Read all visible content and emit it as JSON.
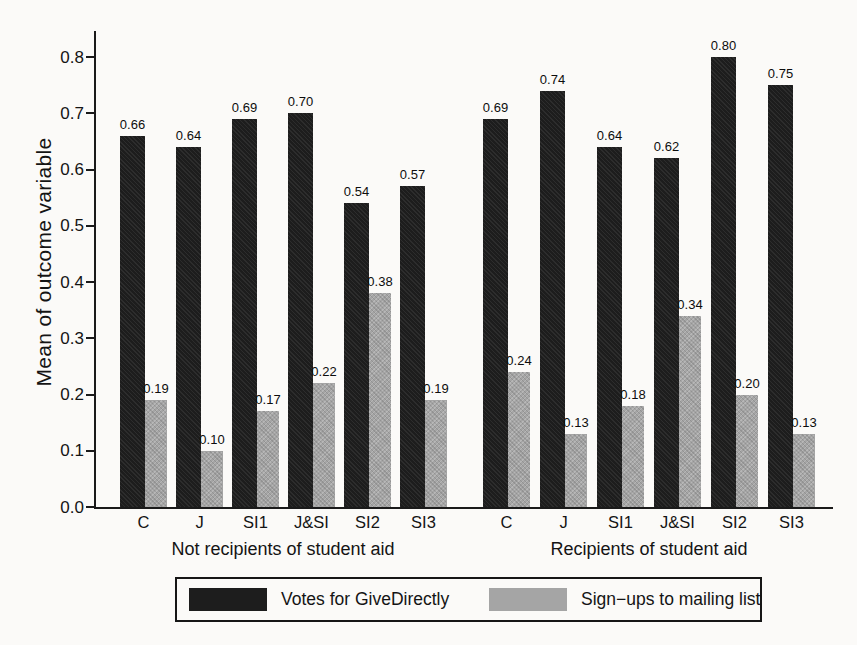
{
  "colors": {
    "dark": "#1d1d1d",
    "gray": "#a5a5a5",
    "axis": "#1a1a1a",
    "background": "#fbfaf8",
    "text": "#141414"
  },
  "chart_data": {
    "type": "bar",
    "title": "",
    "ylabel": "Mean of outcome variable",
    "xlabel": "",
    "ylim": [
      0.0,
      0.8
    ],
    "yticks": [
      0.0,
      0.1,
      0.2,
      0.3,
      0.4,
      0.5,
      0.6,
      0.7,
      0.8
    ],
    "grid": false,
    "legend_position": "bottom",
    "categories": [
      "C",
      "J",
      "SI1",
      "J&SI",
      "SI2",
      "SI3"
    ],
    "groups": [
      {
        "label": "Not recipients of student aid",
        "series": [
          {
            "name": "Votes for GiveDirectly",
            "color_key": "dark",
            "values": [
              0.66,
              0.64,
              0.69,
              0.7,
              0.54,
              0.57
            ]
          },
          {
            "name": "Sign−ups to mailing list",
            "color_key": "gray",
            "values": [
              0.19,
              0.1,
              0.17,
              0.22,
              0.38,
              0.19
            ]
          }
        ]
      },
      {
        "label": "Recipients of student aid",
        "series": [
          {
            "name": "Votes for GiveDirectly",
            "color_key": "dark",
            "values": [
              0.69,
              0.74,
              0.64,
              0.62,
              0.8,
              0.75
            ]
          },
          {
            "name": "Sign−ups to mailing list",
            "color_key": "gray",
            "values": [
              0.24,
              0.13,
              0.18,
              0.34,
              0.2,
              0.13
            ]
          }
        ]
      }
    ],
    "legend": [
      {
        "label": "Votes for GiveDirectly",
        "color_key": "dark"
      },
      {
        "label": "Sign−ups to mailing list",
        "color_key": "gray"
      }
    ]
  }
}
